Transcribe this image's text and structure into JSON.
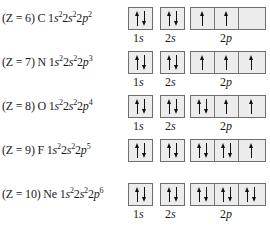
{
  "rows": [
    {
      "z": "(Z = 6)",
      "element": "C",
      "config": [
        {
          "n": "1",
          "l": "s",
          "e": "2"
        },
        {
          "n": "2",
          "l": "s",
          "e": "2"
        },
        {
          "n": "2",
          "l": "p",
          "e": "2"
        }
      ],
      "orbitals": {
        "1s": [
          "up-down"
        ],
        "2s": [
          "up-down"
        ],
        "2p": [
          "up",
          "up",
          "empty"
        ]
      },
      "show_labels": true
    },
    {
      "z": "(Z = 7)",
      "element": "N",
      "config": [
        {
          "n": "1",
          "l": "s",
          "e": "2"
        },
        {
          "n": "2",
          "l": "s",
          "e": "2"
        },
        {
          "n": "2",
          "l": "p",
          "e": "3"
        }
      ],
      "orbitals": {
        "1s": [
          "up-down"
        ],
        "2s": [
          "up-down"
        ],
        "2p": [
          "up",
          "up",
          "up"
        ]
      },
      "show_labels": true
    },
    {
      "z": "(Z = 8)",
      "element": "O",
      "config": [
        {
          "n": "1",
          "l": "s",
          "e": "2"
        },
        {
          "n": "2",
          "l": "s",
          "e": "2"
        },
        {
          "n": "2",
          "l": "p",
          "e": "4"
        }
      ],
      "orbitals": {
        "1s": [
          "up-down"
        ],
        "2s": [
          "up-down"
        ],
        "2p": [
          "up-down",
          "up",
          "up"
        ]
      },
      "show_labels": true
    },
    {
      "z": "(Z = 9)",
      "element": "F",
      "config": [
        {
          "n": "1",
          "l": "s",
          "e": "2"
        },
        {
          "n": "2",
          "l": "s",
          "e": "2"
        },
        {
          "n": "2",
          "l": "p",
          "e": "5"
        }
      ],
      "orbitals": {
        "1s": [
          "up-down"
        ],
        "2s": [
          "up-down"
        ],
        "2p": [
          "up-down",
          "up-down",
          "up"
        ]
      },
      "show_labels": false
    },
    {
      "z": "(Z = 10)",
      "element": "Ne",
      "config": [
        {
          "n": "1",
          "l": "s",
          "e": "2"
        },
        {
          "n": "2",
          "l": "s",
          "e": "2"
        },
        {
          "n": "2",
          "l": "p",
          "e": "6"
        }
      ],
      "orbitals": {
        "1s": [
          "up-down"
        ],
        "2s": [
          "up-down"
        ],
        "2p": [
          "up-down",
          "up-down",
          "up-down"
        ]
      },
      "show_labels": true
    }
  ],
  "labels": {
    "s1": {
      "n": "1",
      "l": "s"
    },
    "s2": {
      "n": "2",
      "l": "s"
    },
    "p2": {
      "n": "2",
      "l": "p"
    }
  },
  "row_tops": [
    7,
    51,
    95,
    139,
    183
  ]
}
